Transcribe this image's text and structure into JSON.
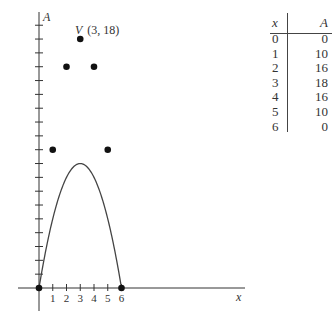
{
  "chart_data": {
    "type": "line",
    "title": "",
    "xlabel": "x",
    "ylabel": "A",
    "x_tick_labels": [
      "1",
      "2",
      "3",
      "4",
      "5",
      "6"
    ],
    "x": [
      0,
      1,
      2,
      3,
      4,
      5,
      6
    ],
    "series": [
      {
        "name": "A = x(6 - x) parabola",
        "values": [
          0,
          10,
          16,
          18,
          16,
          10,
          0
        ]
      }
    ],
    "points": [
      [
        0,
        0
      ],
      [
        1,
        10
      ],
      [
        2,
        16
      ],
      [
        3,
        18
      ],
      [
        4,
        16
      ],
      [
        5,
        10
      ],
      [
        6,
        0
      ]
    ],
    "annotations": [
      {
        "label": "V",
        "text": "(3, 18)",
        "x": 3,
        "y": 18
      }
    ],
    "xlim": [
      -0.5,
      14.5
    ],
    "ylim": [
      -1.5,
      20
    ],
    "y_ticks_every": 1,
    "grid": false,
    "legend": "none"
  },
  "graph": {
    "x_axis_label": "x",
    "y_axis_label": "A",
    "vertex_label": "V",
    "vertex_coords": "(3, 18)",
    "x_ticks": [
      "1",
      "2",
      "3",
      "4",
      "5",
      "6"
    ]
  },
  "table": {
    "header": {
      "x": "x",
      "A": "A"
    },
    "rows": [
      {
        "x": "0",
        "A": "0"
      },
      {
        "x": "1",
        "A": "10"
      },
      {
        "x": "2",
        "A": "16"
      },
      {
        "x": "3",
        "A": "18"
      },
      {
        "x": "4",
        "A": "16"
      },
      {
        "x": "5",
        "A": "10"
      },
      {
        "x": "6",
        "A": "0"
      }
    ]
  }
}
